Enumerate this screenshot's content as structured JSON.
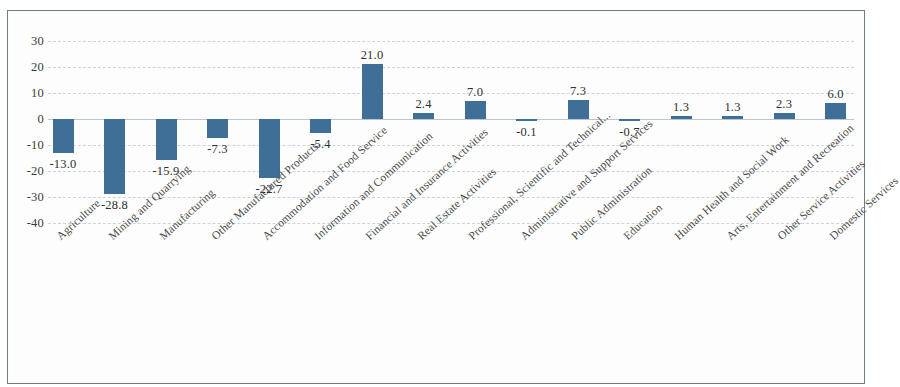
{
  "chart_data": {
    "type": "bar",
    "title": "",
    "subtitle": "",
    "xlabel": "",
    "ylabel": "",
    "ylim": [
      -40,
      30
    ],
    "yticks": [
      30,
      20,
      10,
      0,
      -10,
      -20,
      -30,
      -40
    ],
    "ytick_labels": [
      "30",
      "20",
      "10",
      "0",
      "-10",
      "-20",
      "-30",
      "-40"
    ],
    "grid": true,
    "legend": "none",
    "bar_color": "#3f6f96",
    "categories": [
      "Agriculture",
      "Mining and Quarrying",
      "Manufacturing",
      "Other Manufactured Products",
      "Accommodation and Food Service",
      "Information and Communication",
      "Financial and Insurance Activities",
      "Real Estate Activities",
      "Professional, Scientific and Technical...",
      "Administrative and Support Services",
      "Public Administration",
      "Education",
      "Human Health and Social Work",
      "Arts, Entertainment and Recreation",
      "Other Service Activities",
      "Domestic Services"
    ],
    "values": [
      -13.0,
      -28.8,
      -15.9,
      -7.3,
      -22.7,
      -5.4,
      21.0,
      2.4,
      7.0,
      -0.1,
      7.3,
      -0.7,
      1.3,
      1.3,
      2.3,
      6.0
    ],
    "value_labels": [
      "-13.0",
      "-28.8",
      "-15.9",
      "-7.3",
      "-22.7",
      "-5.4",
      "21.0",
      "2.4",
      "7.0",
      "-0.1",
      "7.3",
      "-0.7",
      "1.3",
      "1.3",
      "2.3",
      "6.0"
    ]
  }
}
